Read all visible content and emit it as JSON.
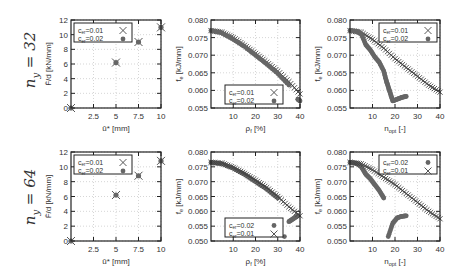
{
  "rows": [
    {
      "label_base": "n",
      "label_sub": "y",
      "label_eq": " = 32"
    },
    {
      "label_base": "n",
      "label_sub": "y",
      "label_eq": " = 64"
    }
  ],
  "chart_data": [
    {
      "id": "r1c1",
      "type": "scatter",
      "xlabel": "ū* [mm]",
      "ylabel": "F̄/d  [kN/mm]",
      "xlim": [
        0,
        10
      ],
      "ylim": [
        0,
        12
      ],
      "xticks": [
        "2.5",
        "5",
        "7.5",
        "10"
      ],
      "yticks": [
        "0",
        "2",
        "4",
        "6",
        "8",
        "10",
        "12"
      ],
      "grid": true,
      "legend_position": "upper-left",
      "series": [
        {
          "name": "c_er=0.01",
          "marker": "x",
          "x": [
            0,
            5,
            7.5,
            10
          ],
          "y": [
            0,
            6.2,
            9.0,
            11.0
          ]
        },
        {
          "name": "c_er=0.02",
          "marker": "dot",
          "x": [
            0,
            5,
            7.5,
            10
          ],
          "y": [
            0,
            6.2,
            9.0,
            11.0
          ]
        }
      ]
    },
    {
      "id": "r1c2",
      "type": "scatter",
      "xlabel": "ρ_f [%]",
      "ylabel": "f_e  [kJ/mm]",
      "xlim": [
        0,
        40
      ],
      "ylim": [
        0.055,
        0.08
      ],
      "xticks": [
        "10",
        "20",
        "30",
        "40"
      ],
      "yticks": [
        "0.055",
        "0.060",
        "0.065",
        "0.070",
        "0.075",
        "0.080"
      ],
      "grid": true,
      "legend_position": "lower-left",
      "series": [
        {
          "name": "c_er=0.01",
          "marker": "x",
          "x": [
            0,
            5,
            10,
            15,
            20,
            25,
            30,
            35,
            40
          ],
          "y": [
            0.077,
            0.0765,
            0.075,
            0.0728,
            0.0705,
            0.068,
            0.0655,
            0.0625,
            0.059
          ]
        },
        {
          "name": "c_er=0.02",
          "marker": "dot",
          "x": [
            0,
            5,
            10,
            15,
            20,
            25,
            30,
            35,
            39,
            40
          ],
          "y": [
            0.077,
            0.0763,
            0.0745,
            0.0725,
            0.07,
            0.0675,
            0.0648,
            0.0615,
            0.0575,
            0.057
          ]
        }
      ]
    },
    {
      "id": "r1c3",
      "type": "scatter",
      "xlabel": "n_opt [-]",
      "ylabel": "f_e  [kJ/mm]",
      "xlim": [
        0,
        40
      ],
      "ylim": [
        0.055,
        0.08
      ],
      "xticks": [
        "10",
        "20",
        "30",
        "40"
      ],
      "yticks": [
        "0.055",
        "0.060",
        "0.065",
        "0.070",
        "0.075",
        "0.080"
      ],
      "grid": true,
      "legend_position": "upper-right",
      "series": [
        {
          "name": "c_er=0.01",
          "marker": "x",
          "x": [
            0,
            5,
            10,
            15,
            20,
            25,
            30,
            35,
            40
          ],
          "y": [
            0.077,
            0.0765,
            0.0745,
            0.072,
            0.069,
            0.0665,
            0.064,
            0.0615,
            0.0595
          ]
        },
        {
          "name": "c_er=0.02",
          "marker": "dot",
          "x": [
            0,
            3,
            5,
            7,
            9,
            11,
            13,
            15,
            16,
            17,
            18,
            19,
            21,
            23,
            25
          ],
          "y": [
            0.077,
            0.0768,
            0.076,
            0.073,
            0.0715,
            0.0695,
            0.068,
            0.0655,
            0.063,
            0.061,
            0.059,
            0.057,
            0.0575,
            0.058,
            0.0583
          ]
        }
      ]
    },
    {
      "id": "r2c1",
      "type": "scatter",
      "xlabel": "ū* [mm]",
      "ylabel": "F̄/d  [kN/mm]",
      "xlim": [
        0,
        10
      ],
      "ylim": [
        0,
        12
      ],
      "xticks": [
        "2.5",
        "5",
        "7.5",
        "10"
      ],
      "yticks": [
        "0",
        "2",
        "4",
        "6",
        "8",
        "10",
        "12"
      ],
      "grid": true,
      "legend_position": "upper-left",
      "series": [
        {
          "name": "c_er=0.01",
          "marker": "x",
          "x": [
            0,
            5,
            7.5,
            10
          ],
          "y": [
            0,
            6.2,
            8.8,
            10.8
          ]
        },
        {
          "name": "c_er=0.02",
          "marker": "dot",
          "x": [
            0,
            5,
            7.5,
            10
          ],
          "y": [
            0,
            6.2,
            8.8,
            10.8
          ]
        }
      ]
    },
    {
      "id": "r2c2",
      "type": "scatter",
      "xlabel": "ρ_f [%]",
      "ylabel": "f_e  [kJ/mm]",
      "xlim": [
        0,
        40
      ],
      "ylim": [
        0.05,
        0.08
      ],
      "xticks": [
        "10",
        "20",
        "30",
        "40"
      ],
      "yticks": [
        "0.050",
        "0.055",
        "0.060",
        "0.065",
        "0.070",
        "0.075",
        "0.080"
      ],
      "grid": true,
      "legend_position": "lower-left",
      "series": [
        {
          "name": "c_er=0.02",
          "marker": "dot",
          "x": [
            0,
            5,
            10,
            15,
            20,
            25,
            30,
            33,
            35,
            37,
            39
          ],
          "y": [
            0.0765,
            0.076,
            0.0745,
            0.0725,
            0.07,
            0.0675,
            0.0645,
            0.0515,
            0.0565,
            0.0575,
            0.0585
          ]
        },
        {
          "name": "c_er=0.01",
          "marker": "x",
          "x": [
            0,
            5,
            10,
            15,
            20,
            25,
            30,
            35,
            40
          ],
          "y": [
            0.0765,
            0.0762,
            0.0748,
            0.0728,
            0.0705,
            0.068,
            0.065,
            0.0615,
            0.0585
          ]
        }
      ]
    },
    {
      "id": "r2c3",
      "type": "scatter",
      "xlabel": "n_opt [-]",
      "ylabel": "f_e  [kJ/mm]",
      "xlim": [
        0,
        40
      ],
      "ylim": [
        0.05,
        0.08
      ],
      "xticks": [
        "10",
        "20",
        "30",
        "40"
      ],
      "yticks": [
        "0.050",
        "0.055",
        "0.060",
        "0.065",
        "0.070",
        "0.075",
        "0.080"
      ],
      "grid": true,
      "legend_position": "upper-right",
      "series": [
        {
          "name": "c_er=0.02",
          "marker": "dot",
          "x": [
            0,
            3,
            5,
            7,
            9,
            11,
            13,
            15,
            17,
            19,
            21,
            23,
            25
          ],
          "y": [
            0.0765,
            0.0762,
            0.075,
            0.0725,
            0.071,
            0.069,
            0.067,
            0.0645,
            0.0515,
            0.056,
            0.0578,
            0.0583,
            0.0585
          ]
        },
        {
          "name": "c_er=0.01",
          "marker": "x",
          "x": [
            0,
            5,
            10,
            15,
            20,
            25,
            30,
            35,
            40
          ],
          "y": [
            0.0765,
            0.076,
            0.074,
            0.0715,
            0.069,
            0.066,
            0.063,
            0.06,
            0.0575
          ]
        }
      ]
    }
  ]
}
